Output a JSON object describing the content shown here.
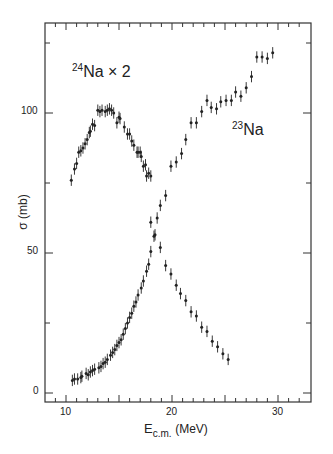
{
  "chart_data": {
    "type": "scatter",
    "title": "",
    "xlabel": "E c.m. (MeV)",
    "xlabel_main": "E",
    "xlabel_sub": "c.m.",
    "xlabel_unit": "(MeV)",
    "ylabel": "σ (mb)",
    "xlim": [
      8.1,
      32.6
    ],
    "ylim": [
      -3,
      132
    ],
    "x_ticks": [
      10,
      20,
      30
    ],
    "x_tick_labels": [
      "10",
      "20",
      "30"
    ],
    "y_ticks": [
      0,
      50,
      100
    ],
    "y_tick_labels": [
      "0",
      "50",
      "100"
    ],
    "grid": false,
    "annotations": [
      {
        "text": "24Na × 2",
        "sup": "24",
        "main": "Na × 2",
        "x": 13.5,
        "y": 116
      },
      {
        "text": "23Na",
        "sup": "23",
        "main": "Na",
        "x": 25.5,
        "y": 97
      }
    ],
    "series": [
      {
        "name": "24Na × 2",
        "x": [
          10.5,
          10.8,
          11.0,
          11.2,
          11.4,
          11.6,
          11.8,
          12.0,
          12.2,
          12.3,
          12.5,
          12.7,
          13.0,
          13.2,
          13.4,
          13.7,
          13.9,
          14.1,
          14.3,
          14.5,
          14.8,
          15.0,
          15.1,
          15.5,
          15.8,
          16.0,
          16.2,
          16.4,
          16.7,
          16.8,
          17.0,
          17.1,
          17.3,
          17.5,
          17.6,
          17.8,
          18.0,
          18.0,
          18.4,
          18.9,
          19.4,
          19.9,
          20.4,
          20.8,
          21.3,
          21.8,
          22.3,
          22.8,
          23.3,
          23.8,
          24.3,
          24.8,
          25.3
        ],
        "y": [
          76,
          80,
          82,
          86,
          86.5,
          87.5,
          89,
          90.5,
          93,
          93.5,
          96,
          95.5,
          101,
          100.5,
          101,
          100.5,
          101,
          101.5,
          101,
          100,
          96.5,
          98.5,
          98,
          95,
          92.5,
          92.5,
          90,
          88.5,
          86,
          86,
          86,
          84.5,
          81,
          81.5,
          77.5,
          78.5,
          77.5,
          61,
          56.5,
          52,
          45.5,
          42.5,
          38.5,
          35.5,
          33,
          29,
          27.5,
          23.5,
          22,
          18.5,
          16.5,
          14,
          12
        ],
        "y_err": 1.5,
        "note": "values are 2× actual 24Na cross section"
      },
      {
        "name": "23Na",
        "x": [
          10.6,
          10.8,
          11.1,
          11.4,
          11.5,
          11.9,
          12.1,
          12.3,
          12.5,
          12.7,
          13.1,
          13.3,
          13.5,
          13.7,
          13.9,
          14.2,
          14.4,
          14.6,
          14.8,
          15.0,
          15.2,
          15.4,
          15.6,
          15.8,
          16.0,
          16.2,
          16.4,
          16.6,
          16.8,
          17.1,
          17.3,
          17.6,
          17.8,
          18.0,
          18.3,
          18.6,
          18.9,
          19.4,
          19.9,
          20.4,
          20.9,
          21.3,
          21.8,
          22.3,
          22.8,
          23.3,
          23.7,
          24.2,
          24.6,
          25.1,
          25.6,
          26.0,
          26.5,
          27.0,
          27.5,
          28.0,
          28.5,
          29.0,
          29.5
        ],
        "y": [
          4.5,
          5,
          5,
          5.5,
          6,
          7,
          6.5,
          7.5,
          8,
          8.5,
          9,
          9.5,
          10.5,
          11,
          12,
          13.5,
          14.5,
          15.5,
          17,
          18,
          19,
          21,
          23,
          25,
          27,
          28.5,
          31,
          32.5,
          35,
          37.5,
          40,
          43.5,
          46,
          50.5,
          56,
          62.5,
          67,
          70.5,
          81,
          82.5,
          85.5,
          90.5,
          96.5,
          96.5,
          100.5,
          104.5,
          102,
          101.5,
          104,
          104.5,
          104.5,
          107.5,
          106,
          109,
          113,
          120,
          120,
          119.5,
          121.5
        ],
        "y_err": 1.5
      }
    ],
    "legend": "none (inline labels)",
    "colors": {
      "points": "#222222",
      "axes": "#333333",
      "background": "#ffffff"
    }
  }
}
